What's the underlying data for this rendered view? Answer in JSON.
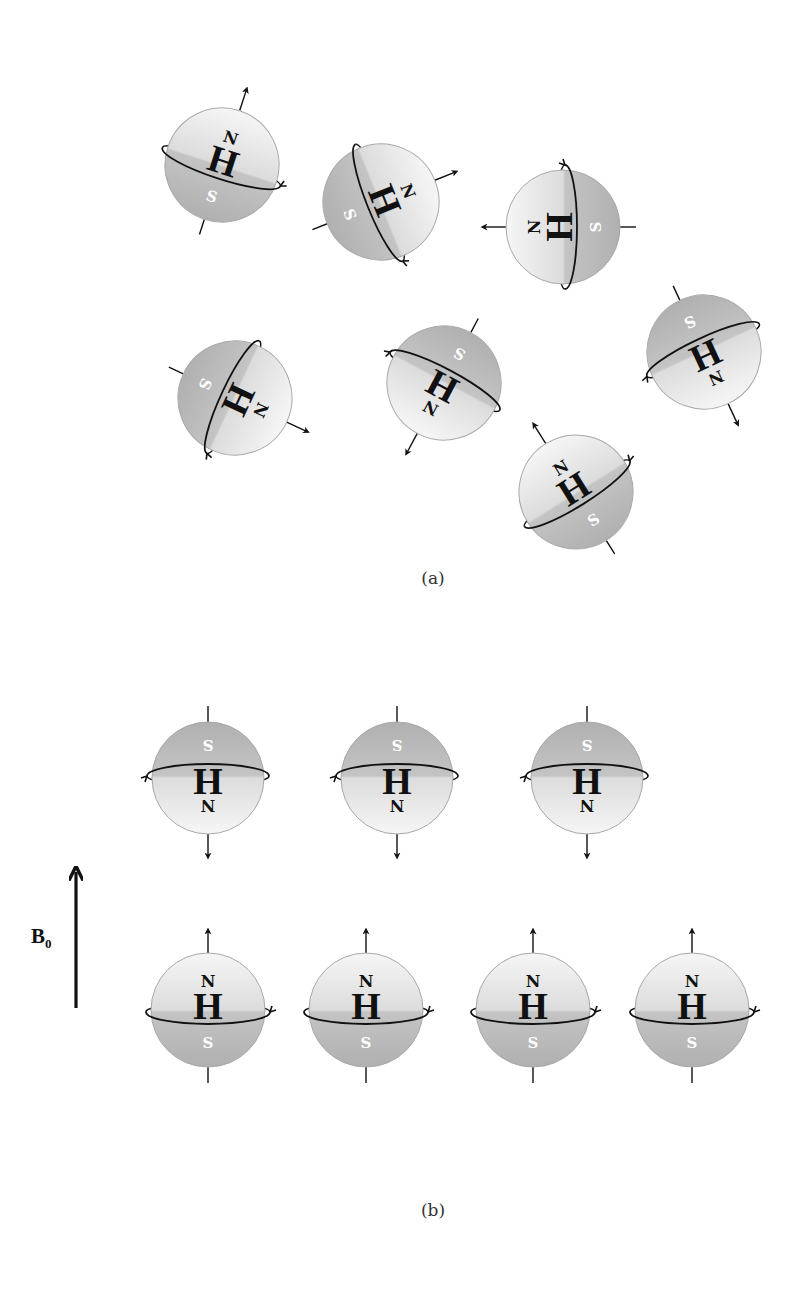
{
  "figure": {
    "panel_a": {
      "caption": "(a)",
      "description": "Randomly oriented hydrogen protons (no external field)",
      "protons": [
        {
          "label": "H",
          "north": "N",
          "south": "S",
          "cx": 222,
          "cy": 165,
          "r": 57,
          "angle": 18
        },
        {
          "label": "H",
          "north": "N",
          "south": "S",
          "cx": 381,
          "cy": 202,
          "r": 58,
          "angle": 68
        },
        {
          "label": "H",
          "north": "N",
          "south": "S",
          "cx": 563,
          "cy": 227,
          "r": 57,
          "angle": 270
        },
        {
          "label": "H",
          "north": "N",
          "south": "S",
          "cx": 235,
          "cy": 398,
          "r": 57,
          "angle": 115
        },
        {
          "label": "H",
          "north": "N",
          "south": "S",
          "cx": 444,
          "cy": 383,
          "r": 57,
          "angle": 208
        },
        {
          "label": "H",
          "north": "N",
          "south": "S",
          "cx": 704,
          "cy": 352,
          "r": 57,
          "angle": 155
        },
        {
          "label": "H",
          "north": "N",
          "south": "S",
          "cx": 576,
          "cy": 492,
          "r": 57,
          "angle": 328
        }
      ]
    },
    "panel_b": {
      "caption": "(b)",
      "description": "Protons aligned parallel and anti-parallel to external field B0",
      "field_label": "B",
      "field_subscript": "0",
      "anti_parallel": [
        {
          "label": "H",
          "north": "N",
          "south": "S",
          "cx": 208,
          "cy": 778,
          "r": 56,
          "angle": 180
        },
        {
          "label": "H",
          "north": "N",
          "south": "S",
          "cx": 397,
          "cy": 778,
          "r": 56,
          "angle": 180
        },
        {
          "label": "H",
          "north": "N",
          "south": "S",
          "cx": 587,
          "cy": 778,
          "r": 56,
          "angle": 180
        }
      ],
      "parallel": [
        {
          "label": "H",
          "north": "N",
          "south": "S",
          "cx": 208,
          "cy": 1010,
          "r": 57,
          "angle": 0
        },
        {
          "label": "H",
          "north": "N",
          "south": "S",
          "cx": 366,
          "cy": 1010,
          "r": 57,
          "angle": 0
        },
        {
          "label": "H",
          "north": "N",
          "south": "S",
          "cx": 533,
          "cy": 1010,
          "r": 57,
          "angle": 0
        },
        {
          "label": "H",
          "north": "N",
          "south": "S",
          "cx": 692,
          "cy": 1010,
          "r": 57,
          "angle": 0
        }
      ]
    },
    "colors": {
      "sphere_light": "#f4f4f4",
      "sphere_dark": "#b4b4b4",
      "sphere_outline": "#a8a8a8",
      "ink": "#111111",
      "south_label": "#ffffff"
    }
  }
}
